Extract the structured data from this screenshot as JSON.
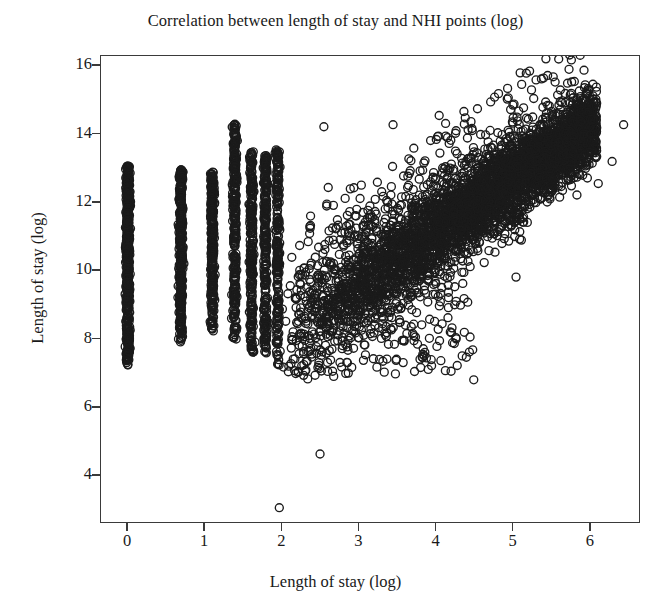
{
  "chart_data": {
    "type": "scatter",
    "title": "Correlation between length of stay and NHI points (log)",
    "xlabel": "Length of stay (log)",
    "ylabel": "Length of stay (log)",
    "xlim": [
      -0.35,
      6.65
    ],
    "ylim": [
      2.6,
      16.3
    ],
    "xticks": [
      0,
      1,
      2,
      3,
      4,
      5,
      6
    ],
    "yticks": [
      4,
      6,
      8,
      10,
      12,
      14,
      16
    ],
    "xticklabels": [
      "0",
      "1",
      "2",
      "3",
      "4",
      "5",
      "6"
    ],
    "yticklabels": [
      "4",
      "6",
      "8",
      "10",
      "12",
      "14",
      "16"
    ],
    "grid": false,
    "legend": null,
    "marker": {
      "shape": "open-circle",
      "diameter_px": 8,
      "stroke_width_px": 1.35,
      "stroke_color": "#1b1b1b",
      "fill": "none"
    },
    "n_points_approx": 6400,
    "discrete_columns": [
      {
        "x": 0.0,
        "y_min": 7.22,
        "y_max": 13.08,
        "n": 520,
        "gap_low": 7.45,
        "isolated_low": [
          7.22
        ]
      },
      {
        "x": 0.69,
        "y_min": 7.85,
        "y_max": 12.95,
        "n": 360
      },
      {
        "x": 1.1,
        "y_min": 8.2,
        "y_max": 12.9,
        "n": 300
      },
      {
        "x": 1.39,
        "y_min": 7.95,
        "y_max": 14.3,
        "n": 280
      },
      {
        "x": 1.61,
        "y_min": 7.55,
        "y_max": 13.55,
        "n": 260
      },
      {
        "x": 1.79,
        "y_min": 7.3,
        "y_max": 13.4,
        "n": 240
      },
      {
        "x": 1.95,
        "y_min": 7.2,
        "y_max": 13.6,
        "n": 230
      }
    ],
    "band": {
      "x_start": 2.0,
      "x_end": 6.1,
      "trend_intercept": 5.05,
      "trend_slope": 1.52,
      "half_width_at_start": 1.9,
      "half_width_at_end": 0.95,
      "n": 4200
    },
    "outliers": [
      {
        "x": 1.97,
        "y": 3.02
      },
      {
        "x": 2.5,
        "y": 4.6
      },
      {
        "x": 4.5,
        "y": 6.78
      },
      {
        "x": 5.05,
        "y": 9.8
      },
      {
        "x": 6.45,
        "y": 14.28
      },
      {
        "x": 6.3,
        "y": 13.2
      },
      {
        "x": 6.12,
        "y": 12.55
      },
      {
        "x": 5.95,
        "y": 15.45
      },
      {
        "x": 5.72,
        "y": 15.5
      },
      {
        "x": 5.28,
        "y": 15.05
      },
      {
        "x": 4.72,
        "y": 14.95
      },
      {
        "x": 4.05,
        "y": 14.55
      },
      {
        "x": 3.45,
        "y": 14.28
      },
      {
        "x": 2.55,
        "y": 14.22
      }
    ]
  },
  "colors": {
    "background": "#ffffff",
    "axis": "#3a3a3a",
    "marker": "#1b1b1b",
    "text": "#191919"
  }
}
